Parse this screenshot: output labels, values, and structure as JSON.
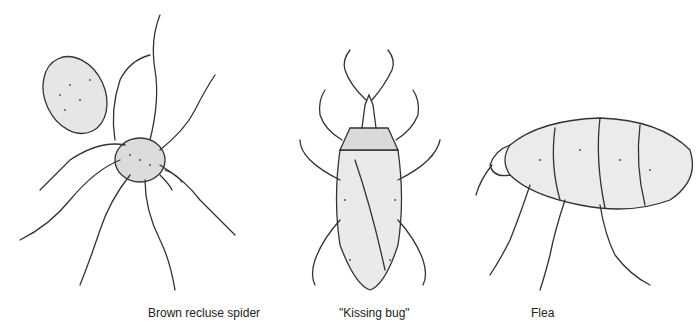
{
  "illustrations": [
    {
      "id": "spider",
      "caption": "Brown recluse spider"
    },
    {
      "id": "kissing-bug",
      "caption": "\"Kissing bug\""
    },
    {
      "id": "flea",
      "caption": "Flea"
    }
  ]
}
